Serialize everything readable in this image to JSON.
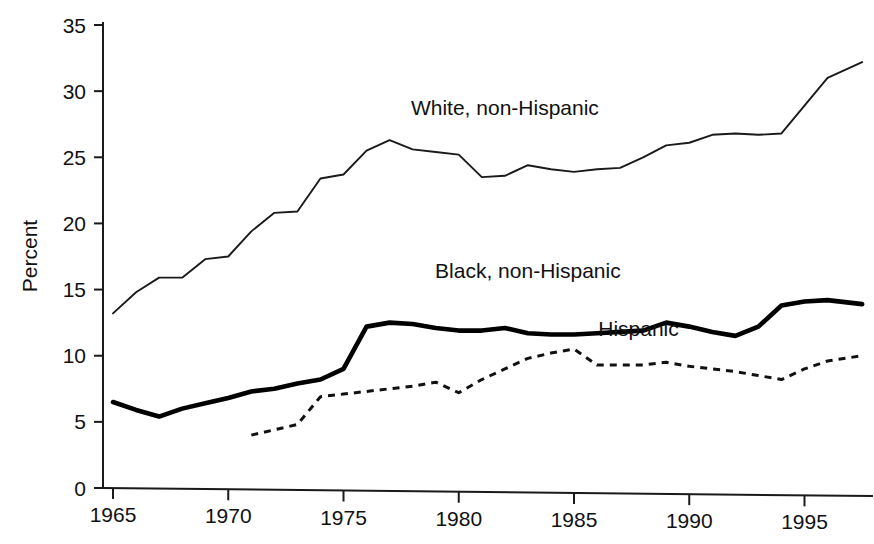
{
  "chart_data": {
    "type": "line",
    "title": "",
    "xlabel": "",
    "ylabel": "Percent",
    "xlim": [
      1964.2,
      1998.6
    ],
    "ylim": [
      0,
      35
    ],
    "grid": false,
    "legend": "inline-labels",
    "yticks": [
      0,
      5,
      10,
      15,
      20,
      25,
      30,
      35
    ],
    "ytick_labels": [
      "0",
      "5",
      "10",
      "15",
      "20",
      "25",
      "30",
      "35"
    ],
    "xticks": [
      1965,
      1970,
      1975,
      1980,
      1985,
      1990,
      1995
    ],
    "xtick_labels": [
      "1965",
      "1970",
      "1975",
      "1980",
      "1985",
      "1990",
      "1995"
    ],
    "series": [
      {
        "name": "White, non-Hispanic",
        "style": "thin-solid",
        "label_x": 1982.0,
        "label_y": 28.2,
        "x": [
          1965,
          1966,
          1967,
          1968,
          1969,
          1970,
          1971,
          1972,
          1973,
          1974,
          1975,
          1976,
          1977,
          1978,
          1979,
          1980,
          1981,
          1982,
          1983,
          1984,
          1985,
          1986,
          1987,
          1988,
          1989,
          1990,
          1991,
          1992,
          1993,
          1994,
          1995,
          1996,
          1997.5
        ],
        "values": [
          13.2,
          14.8,
          15.9,
          15.9,
          17.3,
          17.5,
          19.4,
          20.8,
          20.9,
          23.4,
          23.7,
          25.5,
          26.3,
          25.6,
          25.4,
          25.2,
          23.5,
          23.6,
          24.4,
          24.1,
          23.9,
          24.1,
          24.2,
          25.0,
          25.9,
          26.1,
          26.7,
          26.8,
          26.7,
          26.8,
          28.9,
          31.0,
          32.2
        ]
      },
      {
        "name": "Black, non-Hispanic",
        "style": "thick-solid",
        "label_x": 1983.0,
        "label_y": 15.9,
        "x": [
          1965,
          1966,
          1967,
          1968,
          1969,
          1970,
          1971,
          1972,
          1973,
          1974,
          1975,
          1976,
          1977,
          1978,
          1979,
          1980,
          1981,
          1982,
          1983,
          1984,
          1985,
          1986,
          1987,
          1988,
          1989,
          1990,
          1991,
          1992,
          1993,
          1994,
          1995,
          1996,
          1997.5
        ],
        "values": [
          6.5,
          5.9,
          5.4,
          6.0,
          6.4,
          6.8,
          7.3,
          7.5,
          7.9,
          8.2,
          9.0,
          12.2,
          12.5,
          12.4,
          12.1,
          11.9,
          11.9,
          12.1,
          11.7,
          11.6,
          11.6,
          11.7,
          11.8,
          11.9,
          12.5,
          12.2,
          11.8,
          11.5,
          12.2,
          13.8,
          14.1,
          14.2,
          13.9
        ]
      },
      {
        "name": "Hispanic",
        "style": "dashed",
        "label_x": 1987.8,
        "label_y": 11.5,
        "x": [
          1971,
          1972,
          1973,
          1974,
          1975,
          1976,
          1977,
          1978,
          1979,
          1980,
          1981,
          1982,
          1983,
          1984,
          1985,
          1986,
          1987,
          1988,
          1989,
          1990,
          1991,
          1992,
          1993,
          1994,
          1995,
          1996,
          1997.5
        ],
        "values": [
          4.0,
          4.4,
          4.8,
          6.9,
          7.1,
          7.3,
          7.5,
          7.7,
          8.0,
          7.2,
          8.2,
          9.0,
          9.8,
          10.2,
          10.5,
          9.3,
          9.3,
          9.3,
          9.5,
          9.2,
          9.0,
          8.8,
          8.5,
          8.2,
          9.0,
          9.6,
          10.0
        ]
      }
    ]
  }
}
